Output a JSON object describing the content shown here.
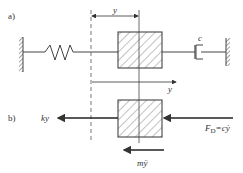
{
  "panels": {
    "a": {
      "label": "a)",
      "displacement_label": "y",
      "axis_label": "y",
      "damper_label": "c"
    },
    "b": {
      "label": "b)",
      "spring_force_label": "ky",
      "damping_force_label": "F_D=cẏ",
      "damping_force_main": "F",
      "damping_force_sub": "D",
      "damping_force_rest": "=cẏ",
      "inertia_force_label": "mÿ"
    }
  },
  "colors": {
    "line": "#444444",
    "hatch": "#666666",
    "text": "#333333"
  }
}
